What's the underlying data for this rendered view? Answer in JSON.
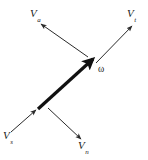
{
  "figure": {
    "type": "vector-diagram",
    "background_color": "#ffffff",
    "ink_color": "#1a1a1a",
    "width": 148,
    "height": 160
  },
  "main_vector": {
    "name": "angular-velocity-vector",
    "label": "ω",
    "style": "thick-solid-arrow",
    "stroke_width": 3.2,
    "color": "#111111",
    "x1": 38,
    "y1": 109,
    "x2": 93,
    "y2": 59,
    "label_x": 98,
    "label_y": 65
  },
  "component_vectors": [
    {
      "name": "upper-left-component",
      "symbol": "V",
      "subscript": "a",
      "style": "thin-solid-arrow",
      "stroke_width": 1,
      "color": "#2a2a2a",
      "x1": 88,
      "y1": 57,
      "x2": 41,
      "y2": 24,
      "label_x": 30,
      "label_y": 8
    },
    {
      "name": "upper-right-component",
      "symbol": "V",
      "subscript": "t",
      "style": "thin-solid-arrow",
      "stroke_width": 1,
      "color": "#2a2a2a",
      "x1": 96,
      "y1": 63,
      "x2": 132,
      "y2": 26,
      "label_x": 127,
      "label_y": 8
    },
    {
      "name": "lower-left-component",
      "symbol": "V",
      "subscript": "s",
      "style": "thin-solid-arrow",
      "stroke_width": 1,
      "color": "#2a2a2a",
      "x1": 11,
      "y1": 132,
      "x2": 36,
      "y2": 110,
      "label_x": 3,
      "label_y": 130
    },
    {
      "name": "lower-right-component",
      "symbol": "V",
      "subscript": "n",
      "style": "thin-solid-arrow",
      "stroke_width": 1,
      "color": "#2a2a2a",
      "x1": 48,
      "y1": 108,
      "x2": 81,
      "y2": 139,
      "label_x": 78,
      "label_y": 140
    }
  ]
}
